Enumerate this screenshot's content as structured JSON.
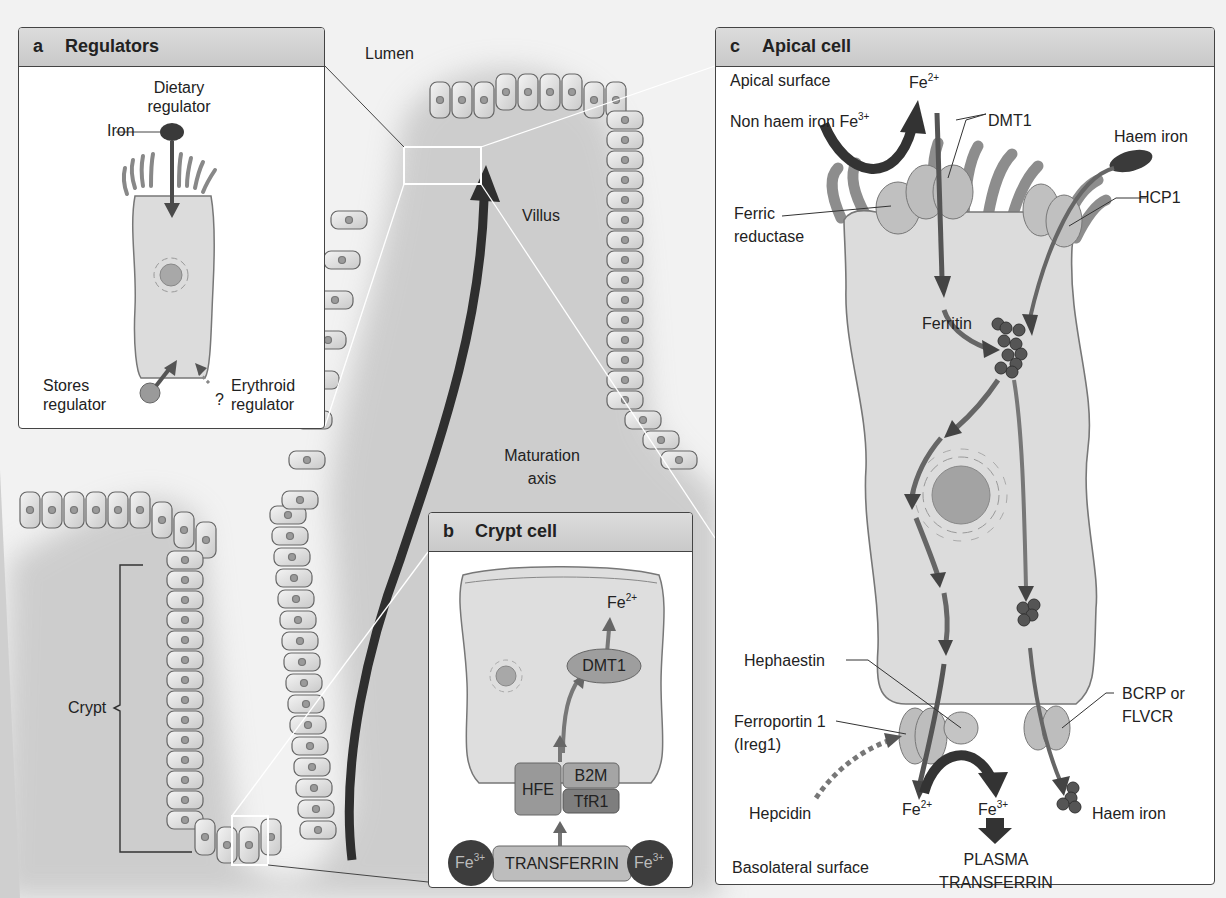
{
  "figure": {
    "background_labels": {
      "lumen": "Lumen",
      "villus": "Villus",
      "maturation_axis_line1": "Maturation",
      "maturation_axis_line2": "axis",
      "crypt": "Crypt"
    },
    "panels": {
      "a": {
        "letter": "a",
        "title": "Regulators",
        "labels": {
          "dietary_regulator_line1": "Dietary",
          "dietary_regulator_line2": "regulator",
          "iron": "Iron",
          "stores_regulator_line1": "Stores",
          "stores_regulator_line2": "regulator",
          "question_mark": "?",
          "erythroid_regulator_line1": "Erythroid",
          "erythroid_regulator_line2": "regulator"
        }
      },
      "b": {
        "letter": "b",
        "title": "Crypt cell",
        "labels": {
          "fe2_base": "Fe",
          "fe2_charge": "2+",
          "dmt1": "DMT1",
          "hfe": "HFE",
          "b2m": "B2M",
          "tfr1": "TfR1",
          "transferrin": "TRANSFERRIN",
          "fe3_base": "Fe",
          "fe3_charge": "3+"
        }
      },
      "c": {
        "letter": "c",
        "title": "Apical cell",
        "labels": {
          "apical_surface": "Apical surface",
          "fe2_top_base": "Fe",
          "fe2_top_charge": "2+",
          "non_haem_iron": "Non haem iron Fe",
          "non_haem_iron_charge": "3+",
          "dmt1": "DMT1",
          "haem_iron_top": "Haem iron",
          "hcp1": "HCP1",
          "ferric_reductase_line1": "Ferric",
          "ferric_reductase_line2": "reductase",
          "ferritin": "Ferritin",
          "hephaestin": "Hephaestin",
          "ferroportin_line1": "Ferroportin 1",
          "ferroportin_line2": "(Ireg1)",
          "bcrp_line1": "BCRP or",
          "bcrp_line2": "FLVCR",
          "hepcidin": "Hepcidin",
          "fe2_bottom_base": "Fe",
          "fe2_bottom_charge": "2+",
          "fe3_bottom_base": "Fe",
          "fe3_bottom_charge": "3+",
          "haem_iron_bottom": "Haem iron",
          "plasma_line1": "PLASMA",
          "plasma_line2": "TRANSFERRIN",
          "basolateral_surface": "Basolateral surface"
        }
      }
    },
    "colors": {
      "panel_header": "#cfcfcf",
      "cell_fill": "#dedede",
      "protein_fill": "#b8b8b8",
      "iron_dark": "#3a3a3a",
      "arrow_dark": "#3c3c3c",
      "background": "#f2f2f2",
      "tissue_shadow": "#bdbdbd"
    }
  }
}
